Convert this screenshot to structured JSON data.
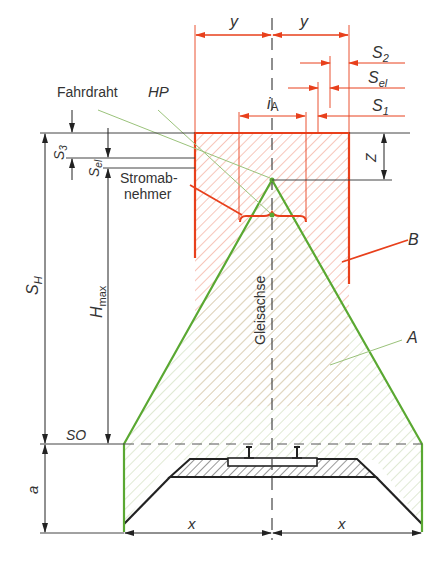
{
  "diagram": {
    "labels": {
      "y_left": "y",
      "y_right": "y",
      "s2": "S",
      "s2_sub": "2",
      "sel": "S",
      "sel_sub": "el",
      "s1": "S",
      "s1_sub": "1",
      "ia": "i",
      "ia_sub": "A",
      "fahrdraht": "Fahrdraht",
      "hp": "HP",
      "s3": "S",
      "s3_sub": "3",
      "sel_left": "S",
      "sel_left_sub": "el",
      "stromabnehmer_1": "Stromab-",
      "stromabnehmer_2": "nehmer",
      "z": "Z",
      "sh": "S",
      "sh_sub": "H",
      "hmax": "H",
      "hmax_sub": "max",
      "b": "B",
      "a_region": "A",
      "gleisachse": "Gleisachse",
      "so": "SO",
      "a_dim": "a",
      "x_left": "x",
      "x_right": "x"
    },
    "colors": {
      "red": "#e8401c",
      "green": "#5aa832",
      "black": "#222222",
      "hatch_red": "#f2a08c",
      "hatch_green": "#b9cfa0"
    }
  }
}
